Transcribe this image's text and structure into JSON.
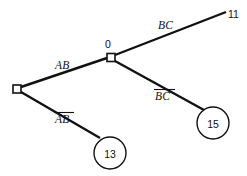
{
  "diagram": {
    "type": "binary-decision-tree",
    "title": "",
    "background_color": "#ffffff",
    "line_color": "#111111",
    "nodes": [
      {
        "id": "root",
        "shape": "square",
        "label": "",
        "x": 17,
        "y": 89
      },
      {
        "id": "inner",
        "shape": "square",
        "label": "0",
        "label_position": "above",
        "x": 111,
        "y": 57.5
      }
    ],
    "leaves": [
      {
        "id": "leaf-11",
        "shape": "terminal-text",
        "label": "11",
        "x": 231,
        "y": 15
      },
      {
        "id": "leaf-15",
        "shape": "circle",
        "label": "15",
        "x": 213,
        "y": 123,
        "r": 16
      },
      {
        "id": "leaf-13",
        "shape": "circle",
        "label": "13",
        "x": 110,
        "y": 153,
        "r": 16
      }
    ],
    "edges": [
      {
        "id": "edge-ab",
        "from": "root",
        "to": "inner",
        "label": "AB",
        "overbar": false,
        "label_x": 55,
        "label_y": 69
      },
      {
        "id": "edge-ab-bar",
        "from": "root",
        "to": "leaf-13",
        "label": "AB",
        "overbar": true,
        "label_x": 55,
        "label_y": 123
      },
      {
        "id": "edge-bc",
        "from": "inner",
        "to": "leaf-11",
        "label": "BC",
        "overbar": false,
        "label_x": 158,
        "label_y": 29
      },
      {
        "id": "edge-bc-bar",
        "from": "inner",
        "to": "leaf-15",
        "label": "BC",
        "overbar": true,
        "label_x": 155,
        "label_y": 100
      }
    ]
  }
}
